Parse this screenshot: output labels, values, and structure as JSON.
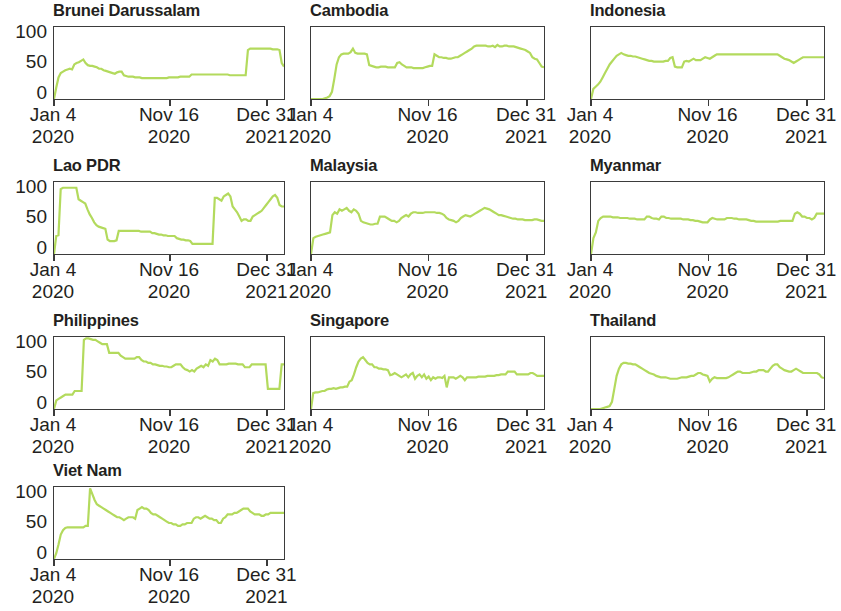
{
  "figure": {
    "type": "small-multiples",
    "panel_count": 10,
    "columns": 3,
    "rows": 4,
    "line_color": "#b3da5d",
    "axis_color": "#3b3b3b",
    "text_color": "#231f20",
    "background": "#ffffff",
    "y_ticks": [
      "100",
      "50",
      "0"
    ],
    "y_ticks_shown_on": "first column only",
    "x_ticks": [
      {
        "line1": "Jan 4",
        "line2": "2020"
      },
      {
        "line1": "Nov 16",
        "line2": "2020"
      },
      {
        "line1": "Dec 31",
        "line2": "2021"
      }
    ],
    "note": "Third column is cropped at the right edge of the screenshot"
  },
  "chart_data": {
    "type": "line",
    "title": "",
    "xlabel": "",
    "ylabel": "",
    "ylim": [
      0,
      100
    ],
    "xlim": [
      0,
      100
    ],
    "grid": false,
    "legend": "none",
    "x_tick_labels": [
      "Jan 4 2020",
      "Nov 16 2020",
      "Dec 31 2021"
    ],
    "x_tick_positions": [
      0,
      50,
      92
    ],
    "y_tick_values": [
      0,
      50,
      100
    ],
    "panels": [
      {
        "title": "Brunei Darussalam",
        "values": [
          0,
          16,
          30,
          36,
          38,
          40,
          41,
          42,
          41,
          48,
          50,
          51,
          53,
          55,
          50,
          47,
          46,
          46,
          45,
          44,
          42,
          42,
          40,
          39,
          38,
          37,
          36,
          35,
          37,
          38,
          38,
          33,
          32,
          31,
          31,
          31,
          30,
          30,
          30,
          29,
          29,
          29,
          29,
          29,
          29,
          29,
          29,
          29,
          29,
          29,
          29,
          30,
          30,
          30,
          30,
          30,
          31,
          31,
          31,
          31,
          31,
          34,
          34,
          34,
          34,
          34,
          34,
          34,
          34,
          34,
          34,
          34,
          34,
          34,
          34,
          34,
          34,
          34,
          33,
          33,
          33,
          33,
          33,
          33,
          33,
          33,
          68,
          70,
          70,
          70,
          70,
          70,
          70,
          70,
          70,
          70,
          70,
          69,
          69,
          69,
          68,
          50,
          45
        ]
      },
      {
        "title": "Cambodia",
        "values": [
          0,
          0,
          0,
          0,
          0,
          0,
          1,
          2,
          4,
          10,
          28,
          48,
          58,
          62,
          63,
          63,
          63,
          65,
          70,
          64,
          63,
          63,
          63,
          63,
          62,
          47,
          46,
          45,
          44,
          44,
          45,
          45,
          45,
          44,
          44,
          44,
          44,
          50,
          51,
          48,
          46,
          44,
          44,
          44,
          43,
          43,
          43,
          43,
          43,
          44,
          45,
          46,
          46,
          62,
          60,
          58,
          58,
          57,
          57,
          56,
          56,
          57,
          58,
          58,
          60,
          62,
          64,
          66,
          68,
          70,
          73,
          74,
          74,
          74,
          74,
          74,
          73,
          73,
          74,
          72,
          75,
          73,
          73,
          74,
          74,
          73,
          73,
          73,
          72,
          71,
          70,
          69,
          68,
          66,
          64,
          58,
          56,
          55,
          50,
          45,
          44
        ]
      },
      {
        "title": "Indonesia",
        "values": [
          0,
          14,
          17,
          20,
          24,
          30,
          36,
          42,
          48,
          52,
          56,
          60,
          62,
          64,
          62,
          61,
          60,
          60,
          59,
          59,
          58,
          57,
          56,
          55,
          54,
          53,
          53,
          52,
          52,
          52,
          52,
          52,
          53,
          53,
          57,
          58,
          45,
          44,
          44,
          44,
          52,
          53,
          52,
          54,
          56,
          54,
          54,
          54,
          56,
          58,
          57,
          56,
          58,
          60,
          62,
          62,
          62,
          62,
          62,
          62,
          62,
          62,
          62,
          62,
          62,
          62,
          62,
          62,
          62,
          62,
          62,
          62,
          62,
          62,
          62,
          62,
          62,
          62,
          62,
          62,
          62,
          60,
          58,
          56,
          55,
          54,
          52,
          50,
          52,
          54,
          56,
          58,
          58,
          58,
          58,
          58,
          58,
          58,
          58,
          58,
          58
        ]
      },
      {
        "title": "Lao PDR",
        "values": [
          0,
          25,
          26,
          90,
          92,
          92,
          92,
          92,
          92,
          92,
          92,
          76,
          74,
          72,
          70,
          62,
          55,
          50,
          44,
          40,
          38,
          37,
          36,
          35,
          20,
          18,
          18,
          18,
          19,
          32,
          32,
          32,
          32,
          32,
          32,
          32,
          32,
          32,
          32,
          31,
          31,
          31,
          31,
          31,
          29,
          29,
          28,
          27,
          27,
          26,
          26,
          25,
          25,
          25,
          25,
          22,
          21,
          20,
          20,
          19,
          19,
          18,
          14,
          14,
          14,
          14,
          14,
          14,
          14,
          14,
          14,
          14,
          78,
          78,
          76,
          74,
          80,
          82,
          84,
          80,
          66,
          62,
          58,
          52,
          46,
          48,
          48,
          46,
          46,
          52,
          54,
          56,
          58,
          60,
          64,
          68,
          72,
          76,
          80,
          82,
          78,
          68,
          66,
          66
        ]
      },
      {
        "title": "Malaysia",
        "values": [
          0,
          22,
          24,
          25,
          26,
          27,
          28,
          29,
          30,
          54,
          58,
          56,
          62,
          60,
          62,
          64,
          60,
          58,
          62,
          60,
          56,
          46,
          44,
          43,
          42,
          41,
          41,
          42,
          42,
          52,
          52,
          52,
          50,
          48,
          46,
          46,
          44,
          46,
          50,
          52,
          54,
          52,
          56,
          58,
          58,
          57,
          57,
          57,
          58,
          58,
          58,
          58,
          58,
          57,
          57,
          56,
          54,
          50,
          48,
          47,
          46,
          44,
          46,
          50,
          52,
          54,
          53,
          52,
          54,
          56,
          58,
          60,
          62,
          64,
          63,
          62,
          60,
          58,
          56,
          54,
          54,
          53,
          52,
          51,
          50,
          49,
          49,
          48,
          48,
          48,
          47,
          47,
          47,
          47,
          48,
          48,
          47,
          46,
          46
        ]
      },
      {
        "title": "Myanmar",
        "values": [
          0,
          22,
          30,
          46,
          50,
          52,
          52,
          52,
          52,
          51,
          51,
          51,
          50,
          50,
          50,
          50,
          49,
          49,
          49,
          48,
          48,
          48,
          48,
          52,
          52,
          50,
          49,
          49,
          48,
          52,
          52,
          50,
          50,
          49,
          49,
          49,
          49,
          49,
          48,
          48,
          48,
          47,
          47,
          46,
          46,
          45,
          44,
          44,
          44,
          48,
          50,
          49,
          48,
          48,
          48,
          48,
          50,
          50,
          50,
          49,
          49,
          48,
          48,
          48,
          48,
          47,
          46,
          46,
          45,
          45,
          45,
          45,
          45,
          45,
          45,
          45,
          45,
          45,
          46,
          46,
          46,
          46,
          46,
          46,
          56,
          58,
          56,
          52,
          52,
          50,
          50,
          48,
          50,
          56,
          56,
          56,
          56
        ]
      },
      {
        "title": "Philippines",
        "values": [
          0,
          12,
          14,
          16,
          18,
          20,
          20,
          20,
          20,
          25,
          25,
          25,
          25,
          96,
          98,
          98,
          97,
          96,
          96,
          94,
          92,
          90,
          90,
          90,
          78,
          78,
          78,
          78,
          78,
          74,
          72,
          70,
          70,
          70,
          70,
          70,
          72,
          72,
          68,
          66,
          66,
          64,
          64,
          62,
          62,
          61,
          60,
          60,
          59,
          59,
          58,
          58,
          60,
          62,
          62,
          62,
          58,
          55,
          54,
          52,
          54,
          52,
          56,
          58,
          60,
          58,
          62,
          60,
          68,
          66,
          70,
          68,
          62,
          62,
          62,
          62,
          63,
          63,
          63,
          63,
          62,
          62,
          62,
          58,
          58,
          58,
          62,
          62,
          62,
          62,
          62,
          62,
          62,
          28,
          28,
          28,
          28,
          28,
          28,
          62,
          62
        ]
      },
      {
        "title": "Singapore",
        "values": [
          0,
          22,
          23,
          23,
          24,
          25,
          25,
          27,
          28,
          28,
          29,
          28,
          29,
          30,
          30,
          31,
          31,
          38,
          40,
          48,
          58,
          66,
          70,
          72,
          68,
          64,
          62,
          62,
          58,
          58,
          56,
          56,
          55,
          55,
          54,
          47,
          48,
          50,
          48,
          46,
          44,
          46,
          48,
          44,
          48,
          50,
          42,
          46,
          48,
          44,
          48,
          42,
          45,
          40,
          44,
          42,
          44,
          44,
          43,
          46,
          30,
          44,
          44,
          44,
          42,
          44,
          46,
          44,
          40,
          44,
          44,
          44,
          44,
          44,
          45,
          45,
          45,
          45,
          46,
          46,
          46,
          46,
          47,
          47,
          48,
          48,
          48,
          52,
          52,
          52,
          52,
          48,
          48,
          48,
          48,
          48,
          48,
          50,
          50,
          48,
          46,
          46,
          46,
          46
        ]
      },
      {
        "title": "Thailand",
        "values": [
          0,
          0,
          0,
          0,
          0,
          1,
          2,
          3,
          4,
          10,
          28,
          46,
          56,
          62,
          64,
          64,
          63,
          63,
          62,
          62,
          60,
          58,
          56,
          54,
          52,
          50,
          49,
          48,
          46,
          45,
          44,
          44,
          44,
          43,
          42,
          42,
          42,
          42,
          43,
          44,
          44,
          44,
          45,
          46,
          46,
          48,
          50,
          50,
          48,
          47,
          46,
          38,
          42,
          44,
          43,
          43,
          43,
          43,
          43,
          44,
          46,
          48,
          50,
          52,
          52,
          50,
          50,
          50,
          50,
          51,
          52,
          52,
          54,
          54,
          54,
          52,
          52,
          56,
          60,
          62,
          62,
          58,
          56,
          54,
          53,
          52,
          52,
          54,
          56,
          54,
          52,
          50,
          50,
          50,
          50,
          50,
          50,
          50,
          48,
          44,
          43
        ]
      },
      {
        "title": "Viet Nam",
        "values": [
          0,
          8,
          20,
          34,
          40,
          43,
          44,
          44,
          44,
          44,
          44,
          44,
          44,
          44,
          46,
          46,
          98,
          90,
          82,
          76,
          74,
          72,
          70,
          68,
          66,
          64,
          62,
          60,
          58,
          58,
          56,
          54,
          56,
          58,
          58,
          58,
          56,
          68,
          70,
          72,
          70,
          70,
          68,
          64,
          62,
          62,
          60,
          58,
          56,
          54,
          52,
          50,
          50,
          48,
          48,
          46,
          46,
          48,
          48,
          50,
          50,
          50,
          56,
          58,
          58,
          56,
          58,
          60,
          58,
          56,
          56,
          54,
          54,
          50,
          50,
          56,
          58,
          62,
          62,
          62,
          64,
          64,
          66,
          68,
          70,
          70,
          70,
          66,
          64,
          62,
          62,
          62,
          60,
          60,
          62,
          62,
          64,
          64,
          64,
          64,
          64,
          64,
          64
        ]
      }
    ]
  }
}
